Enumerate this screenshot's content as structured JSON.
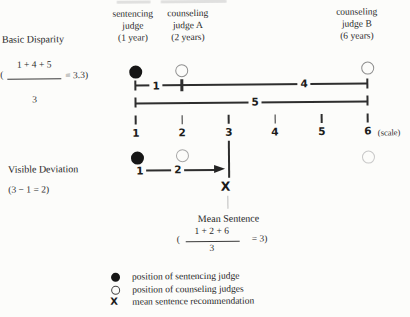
{
  "header": {
    "columns": [
      {
        "label": "sentencing\njudge\n(1 year)"
      },
      {
        "label": "counseling\njudge A\n(2 years)"
      },
      {
        "label": "counseling\njudge B\n(6 years)"
      }
    ]
  },
  "basic_disparity": {
    "title": "Basic Disparity",
    "formula": {
      "open": "(",
      "numerator": "1 + 4 + 5",
      "denominator": "3",
      "result": "= 3.3)"
    },
    "segment_labels": {
      "one_to_two": "1",
      "two_to_six": "4",
      "one_to_six": "5"
    }
  },
  "scale": {
    "labels": [
      "1",
      "2",
      "3",
      "4",
      "5",
      "6"
    ],
    "caption": "(scale)"
  },
  "visible_deviation": {
    "title": "Visible Deviation",
    "formula": "(3 − 1 = 2)",
    "arrow_start_label": "1",
    "arrow_distance_label": "2",
    "mean_marker": "X"
  },
  "mean_sentence": {
    "title": "Mean Sentence",
    "formula": {
      "open": "(",
      "numerator": "1 + 2 + 6",
      "denominator": "3",
      "result": "= 3)"
    }
  },
  "legend": {
    "items": [
      {
        "glyph": "●",
        "label": "position of sentencing judge"
      },
      {
        "glyph": "○",
        "label": "position of counseling judges"
      },
      {
        "glyph": "X",
        "label": "mean sentence recommendation"
      }
    ]
  },
  "diagram": {
    "scale_range": [
      1,
      6
    ],
    "points": [
      {
        "role": "sentencing judge",
        "position": 1,
        "marker": "filled-circle"
      },
      {
        "role": "counseling judge A",
        "position": 2,
        "marker": "open-circle"
      },
      {
        "role": "counseling judge B",
        "position": 6,
        "marker": "open-circle"
      },
      {
        "role": "mean sentence recommendation",
        "position": 3,
        "marker": "X"
      }
    ],
    "basic_disparity_value": 3.3,
    "visible_deviation_value": 2,
    "mean_sentence_value": 3
  }
}
